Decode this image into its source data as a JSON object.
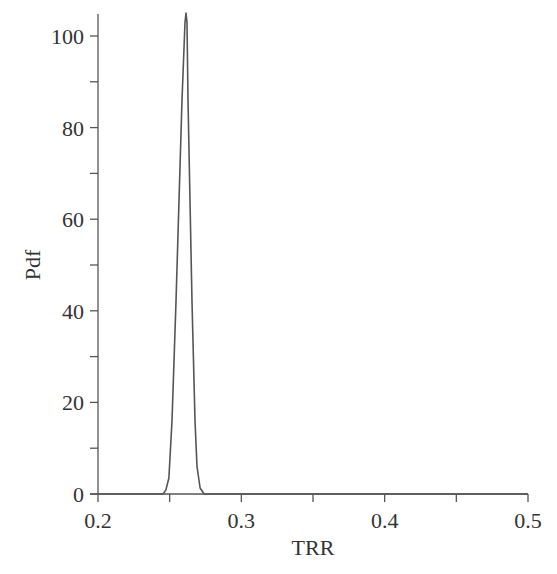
{
  "chart_data": {
    "type": "line",
    "title": "",
    "xlabel": "TRR",
    "ylabel": "Pdf",
    "xlim": [
      0.2,
      0.5
    ],
    "ylim": [
      0,
      105
    ],
    "grid": false,
    "legend": null,
    "x_ticks": [
      0.2,
      0.3,
      0.4,
      0.5
    ],
    "x_tick_labels": [
      "0.2",
      "0.3",
      "0.4",
      "0.5"
    ],
    "x_minor_ticks": [
      0.25,
      0.35,
      0.45
    ],
    "y_ticks": [
      0,
      20,
      40,
      60,
      80,
      100
    ],
    "y_tick_labels": [
      "0",
      "20",
      "40",
      "60",
      "80",
      "100"
    ],
    "y_minor_ticks": [
      10,
      30,
      50,
      70,
      90
    ],
    "series": [
      {
        "name": "Pdf of TRR",
        "color": "#555555",
        "x": [
          0.2,
          0.2454,
          0.2474,
          0.2495,
          0.2516,
          0.2544,
          0.2586,
          0.2607,
          0.2614,
          0.2621,
          0.2628,
          0.2656,
          0.2677,
          0.2691,
          0.2712,
          0.274,
          0.5
        ],
        "y": [
          0,
          0,
          0.9,
          3.5,
          16,
          42,
          86,
          103,
          105,
          103,
          86,
          42,
          16,
          6,
          1.3,
          0,
          0
        ]
      }
    ]
  }
}
